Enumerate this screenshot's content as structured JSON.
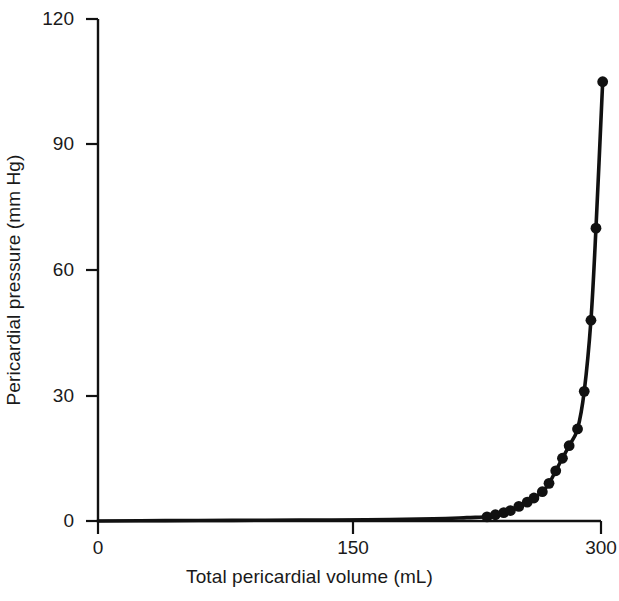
{
  "chart_data": {
    "type": "line",
    "title": "",
    "xlabel": "Total pericardial volume (mL)",
    "ylabel": "Pericardial pressure (mm Hg)",
    "xlim": [
      0,
      300
    ],
    "ylim": [
      0,
      120
    ],
    "xticks": [
      0,
      150,
      300
    ],
    "xtick_labels": [
      "0",
      "150",
      "300"
    ],
    "yticks": [
      0,
      30,
      60,
      90,
      120
    ],
    "ytick_labels": [
      "0",
      "30",
      "60",
      "90",
      "120"
    ],
    "grid": false,
    "legend": null,
    "series": [
      {
        "name": "Pericardial pressure-volume relation",
        "marker": "filled-circle",
        "marker_color": "#111111",
        "line_color": "#111111",
        "x": [
          0,
          40,
          80,
          120,
          160,
          200,
          220,
          232,
          237,
          242,
          246,
          251,
          256,
          260,
          265,
          269,
          273,
          277,
          281,
          286,
          290,
          294,
          297,
          301
        ],
        "y": [
          0,
          0.1,
          0.15,
          0.2,
          0.3,
          0.5,
          0.8,
          1.0,
          1.5,
          2.0,
          2.5,
          3.5,
          4.5,
          5.5,
          7.0,
          9.0,
          12.0,
          15.0,
          18.0,
          22.0,
          31.0,
          48.0,
          70.0,
          105.0
        ],
        "marker_from_index": 7
      }
    ],
    "annotations": []
  },
  "axis_style": {
    "line_color": "#111111",
    "tick_color": "#111111"
  }
}
